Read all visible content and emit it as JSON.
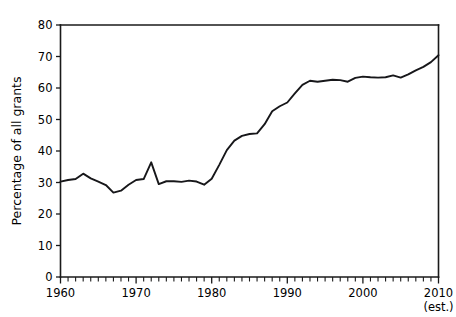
{
  "chart_data": {
    "type": "line",
    "title": "",
    "subtitle": "",
    "xlabel": "",
    "ylabel": "Percentage of all grants",
    "xlim": [
      1960,
      2010
    ],
    "ylim": [
      0,
      80
    ],
    "grid": false,
    "legend": null,
    "legend_position": "none",
    "line_color": "#17171a",
    "axis_color": "#1a1a1a",
    "background_color": "#ffffff",
    "x_tick_labels": [
      "1960",
      "1970",
      "1980",
      "1990",
      "2000",
      "2010"
    ],
    "x_tick_values": [
      1960,
      1970,
      1980,
      1990,
      2000,
      2010
    ],
    "x_minor_tick_interval": 1,
    "y_tick_labels": [
      "0",
      "10",
      "20",
      "30",
      "40",
      "50",
      "60",
      "70",
      "80"
    ],
    "y_tick_values": [
      0,
      10,
      20,
      30,
      40,
      50,
      60,
      70,
      80
    ],
    "annotations": [
      {
        "text": "(est.)",
        "x": 2010,
        "position": "below-axis-label"
      }
    ],
    "series": [
      {
        "name": "Percentage of all grants",
        "x": [
          1960,
          1961,
          1962,
          1963,
          1964,
          1965,
          1966,
          1967,
          1968,
          1969,
          1970,
          1971,
          1972,
          1973,
          1974,
          1975,
          1976,
          1977,
          1978,
          1979,
          1980,
          1981,
          1982,
          1983,
          1984,
          1985,
          1986,
          1987,
          1988,
          1989,
          1990,
          1991,
          1992,
          1993,
          1994,
          1995,
          1996,
          1997,
          1998,
          1999,
          2000,
          2001,
          2002,
          2003,
          2004,
          2005,
          2006,
          2007,
          2008,
          2009,
          2010
        ],
        "values": [
          30.3,
          30.8,
          31.1,
          32.8,
          31.3,
          30.3,
          29.2,
          26.8,
          27.4,
          29.3,
          30.8,
          31.1,
          36.4,
          29.5,
          30.4,
          30.4,
          30.2,
          30.6,
          30.3,
          29.3,
          31.2,
          35.6,
          40.3,
          43.3,
          44.8,
          45.4,
          45.6,
          48.5,
          52.6,
          54.2,
          55.4,
          58.3,
          61.0,
          62.3,
          62.0,
          62.3,
          62.6,
          62.5,
          62.0,
          63.2,
          63.6,
          63.4,
          63.3,
          63.4,
          64.0,
          63.3,
          64.3,
          65.6,
          66.7,
          68.2,
          70.4
        ]
      }
    ]
  },
  "axis": {
    "y_title": "Percentage of all grants",
    "est_note": "(est.)"
  }
}
